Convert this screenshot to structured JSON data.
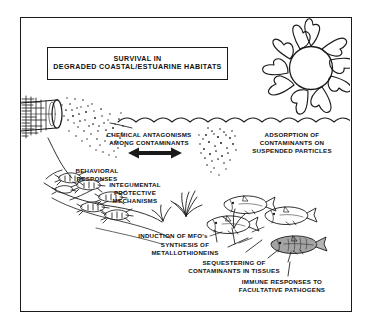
{
  "figure": {
    "domain_kind": "scientific-conceptual-diagram",
    "background_color": "#ffffff",
    "ink_color": "#1a1a1a",
    "frame": {
      "x": 20,
      "y": 17,
      "width": 332,
      "height": 295,
      "border_px": 1.5
    }
  },
  "title_box": {
    "line1": "SURVIVAL IN",
    "line2": "DEGRADED COASTAL/ESTUARINE HABITATS"
  },
  "captions": {
    "chemical_antagonisms": {
      "line1": "CHEMICAL ANTAGONISMS",
      "line2": "AMONG CONTAMINANTS"
    },
    "adsorption": {
      "line1": "ADSORPTION OF",
      "line2": "CONTAMINANTS ON",
      "line3": "SUSPENDED PARTICLES"
    },
    "behavioral": {
      "line1": "BEHAVIORAL",
      "line2": "RESPONSES"
    },
    "integumental": {
      "line1": "INTEGUMENTAL",
      "line2": "PROTECTIVE",
      "line3": "MECHANISMS"
    },
    "induction_mfo": {
      "line1": "INDUCTION OF MFO's"
    },
    "synthesis_metallothioneins": {
      "line1": "SYNTHESIS OF",
      "line2": "METALLOTHIONEINS"
    },
    "sequestering": {
      "line1": "SEQUESTERING OF",
      "line2": "CONTAMINANTS IN TISSUES"
    },
    "immune": {
      "line1": "IMMUNE RESPONSES TO",
      "line2": "FACULTATIVE PATHOGENS"
    }
  },
  "illustrations": {
    "sun": {
      "name": "sun-icon",
      "rays": 10,
      "center": [
        311,
        68
      ],
      "core_radius": 22
    },
    "outfall_pipe": {
      "name": "outfall-pipe-icon",
      "position": [
        22,
        104
      ]
    },
    "contaminant_plume": {
      "name": "contaminant-plume",
      "dot_count": 110
    },
    "water_surface": {
      "name": "water-surface-wave-line",
      "y": 122,
      "scallops": 13
    },
    "suspended_particle_cloud": {
      "name": "suspended-particle-cloud",
      "center": [
        222,
        142
      ],
      "dot_count": 55
    },
    "shrimp_group": {
      "name": "shrimp-group",
      "count": 7
    },
    "seagrass_tufts": {
      "name": "seagrass-tuft",
      "count": 3
    },
    "fish_group": {
      "name": "fish-group",
      "count": 4,
      "shaded_index": 3
    },
    "double_arrow": {
      "name": "double-headed-arrow-icon",
      "position": [
        140,
        152
      ]
    },
    "leader_lines": {
      "name": "leader-line",
      "count": 6
    }
  }
}
